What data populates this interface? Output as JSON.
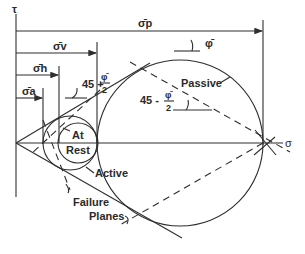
{
  "diagram": {
    "axes": {
      "y_label": "τ",
      "x_label": "σ"
    },
    "stress_labels": {
      "sigma_p": "σ̄p",
      "sigma_v": "σ̄v",
      "sigma_h": "σ̄h",
      "sigma_a": "σ̄a"
    },
    "angles": {
      "active_angle_prefix": "45 +",
      "passive_angle_prefix": "45 -",
      "phi": "φ̄",
      "phi_fraction_num": "φ̄",
      "phi_fraction_den": "2"
    },
    "circles": {
      "at_rest_line1": "At",
      "at_rest_line2": "Rest",
      "active": "Active",
      "passive": "Passive"
    },
    "annotations": {
      "failure_line1": "Failure",
      "failure_line2": "Planes"
    },
    "colors": {
      "line": "#2e2e2e",
      "background": "#ffffff"
    }
  }
}
